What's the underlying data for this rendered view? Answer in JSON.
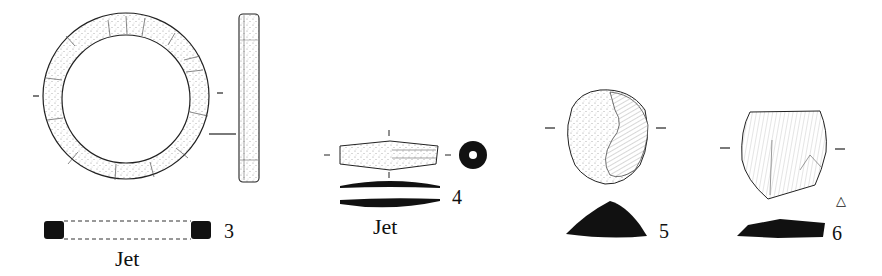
{
  "figure": {
    "background": "#ffffff",
    "ink_color": "#111111",
    "items": [
      {
        "number": "3",
        "material": "Jet",
        "description": "ring, plan view with side profile and section"
      },
      {
        "number": "4",
        "material": "Jet",
        "description": "bead, side view, end view and sections"
      },
      {
        "number": "5",
        "material": "",
        "description": "flint scraper, dorsal view with section"
      },
      {
        "number": "6",
        "material": "",
        "description": "flint flake, dorsal view with section",
        "symbol": "△"
      }
    ]
  }
}
